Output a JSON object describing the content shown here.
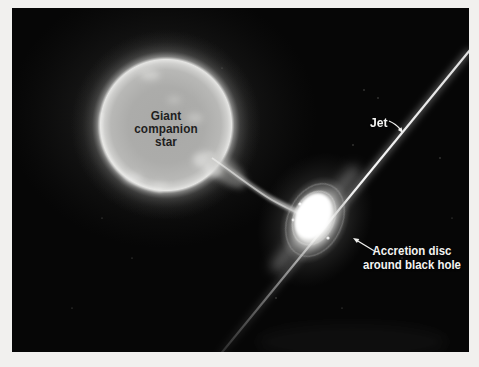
{
  "scene": {
    "description_labels": {
      "companion_star": [
        "Giant",
        "companion",
        "star"
      ],
      "jet": "Jet",
      "accretion_disc": [
        "Accretion disc",
        "around black hole"
      ]
    },
    "icons": {
      "jet_arrow": "curved-arrow-down-right",
      "accretion_arrow": "arrow-up-left"
    },
    "colors": {
      "page_background": "#f1f0ee",
      "space_background": "#060606",
      "star_surface": "#acacaa",
      "star_label_text": "#1e1e1e",
      "light_label_text": "#f4f4f2",
      "jet_and_disc": "#ffffff"
    }
  }
}
